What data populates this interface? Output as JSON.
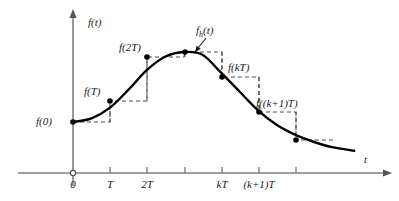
{
  "figure": {
    "axes": {
      "y_label": "f(t)",
      "x_label": "t",
      "origin_label": "0"
    },
    "colors": {
      "curve": "#000000",
      "axis": "#808080",
      "dashed": "#4d4d4d",
      "text": "#1a1a1a",
      "background": "#ffffff"
    }
  },
  "chart_data": {
    "type": "line",
    "title": "",
    "xlabel": "t",
    "ylabel": "f(t)",
    "grid": false,
    "legend": "none",
    "xlim": [
      0,
      8.3
    ],
    "ylim": [
      0,
      1
    ],
    "x_ticks": [
      {
        "value": 0,
        "label": "0",
        "px": 73
      },
      {
        "value": 1,
        "label": "T",
        "px": 110
      },
      {
        "value": 2,
        "label": "2T",
        "px": 147
      },
      {
        "value": 3,
        "label": "",
        "px": 185
      },
      {
        "value": 4,
        "label": "kT",
        "px": 222
      },
      {
        "value": 5,
        "label": "(k+1)T",
        "px": 259
      },
      {
        "value": 6,
        "label": "",
        "px": 296
      }
    ],
    "series": [
      {
        "name": "f(t)",
        "style": "solid",
        "x": [
          0,
          0.5,
          1,
          1.5,
          2,
          2.5,
          3,
          3.5,
          4,
          4.5,
          5,
          5.5,
          6,
          6.5,
          7,
          7.6
        ],
        "y": [
          0.325,
          0.345,
          0.405,
          0.505,
          0.615,
          0.69,
          0.715,
          0.7,
          0.6,
          0.495,
          0.39,
          0.31,
          0.255,
          0.215,
          0.185,
          0.165
        ]
      },
      {
        "name": "f_h(t)",
        "style": "dashed-staircase",
        "x": [
          0,
          1,
          2,
          3,
          4,
          5,
          6
        ],
        "y": [
          0.325,
          0.405,
          0.615,
          0.715,
          0.6,
          0.39,
          0.255
        ]
      }
    ],
    "samples": [
      {
        "label": "f(0)",
        "x": 0,
        "y": 0.325,
        "px": 73,
        "py": 122,
        "label_x": 36,
        "label_y": 116,
        "label_anchor": "left"
      },
      {
        "label": "f(T)",
        "x": 1,
        "y": 0.405,
        "px": 110,
        "py": 101,
        "label_x": 84,
        "label_y": 86,
        "label_anchor": "left"
      },
      {
        "label": "f(2T)",
        "x": 2,
        "y": 0.615,
        "px": 147,
        "py": 57,
        "label_x": 119,
        "label_y": 42,
        "label_anchor": "left"
      },
      {
        "label": "",
        "x": 3,
        "y": 0.715,
        "px": 185,
        "py": 52,
        "label_x": 0,
        "label_y": 0,
        "label_anchor": "none"
      },
      {
        "label": "f(kT)",
        "x": 4,
        "y": 0.6,
        "px": 222,
        "py": 77,
        "label_x": 228,
        "label_y": 62,
        "label_anchor": "left"
      },
      {
        "label": "f((k+1)T)",
        "x": 5,
        "y": 0.39,
        "px": 259,
        "py": 112,
        "label_x": 256,
        "label_y": 98,
        "label_anchor": "left"
      },
      {
        "label": "",
        "x": 6,
        "y": 0.255,
        "px": 296,
        "py": 140,
        "label_x": 0,
        "label_y": 0,
        "label_anchor": "none"
      }
    ],
    "annotations": [
      {
        "label_html": "f<span class='sub'>h</span>(t)",
        "label_plain": "f_h(t)",
        "label_x": 196,
        "label_y": 25,
        "arrow_from": [
          206,
          38
        ],
        "arrow_to": [
          195,
          52
        ]
      }
    ]
  }
}
